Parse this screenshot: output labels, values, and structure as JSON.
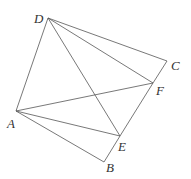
{
  "diagram": {
    "type": "geometry-figure",
    "points": [
      {
        "name": "A",
        "x": 16,
        "y": 111,
        "label_x": 7,
        "label_y": 128
      },
      {
        "name": "B",
        "x": 104,
        "y": 162,
        "label_x": 106,
        "label_y": 172
      },
      {
        "name": "C",
        "x": 167,
        "y": 61,
        "label_x": 171,
        "label_y": 70
      },
      {
        "name": "D",
        "x": 48,
        "y": 18,
        "label_x": 34,
        "label_y": 23
      },
      {
        "name": "E",
        "x": 120,
        "y": 136,
        "label_x": 118,
        "label_y": 151
      },
      {
        "name": "F",
        "x": 153,
        "y": 83,
        "label_x": 156,
        "label_y": 95
      }
    ],
    "segments": [
      [
        "D",
        "C"
      ],
      [
        "C",
        "F"
      ],
      [
        "F",
        "E"
      ],
      [
        "E",
        "B"
      ],
      [
        "B",
        "A"
      ],
      [
        "A",
        "D"
      ],
      [
        "D",
        "F"
      ],
      [
        "D",
        "E"
      ],
      [
        "A",
        "F"
      ],
      [
        "A",
        "E"
      ]
    ],
    "colors": {
      "line": "#555555",
      "label": "#333333",
      "background": "#ffffff"
    }
  }
}
